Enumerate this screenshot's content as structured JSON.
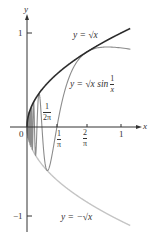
{
  "chart_data": {
    "type": "line",
    "title": "",
    "xlabel": "x",
    "ylabel": "y",
    "xlim": [
      0,
      1.1
    ],
    "ylim": [
      -1.1,
      1.15
    ],
    "grid": false,
    "x_ticks": [
      {
        "value": 0.1592,
        "label_num": "1",
        "label_den": "2π"
      },
      {
        "value": 0.3183,
        "label_num": "1",
        "label_den": "π"
      },
      {
        "value": 0.6366,
        "label_num": "2",
        "label_den": "π"
      },
      {
        "value": 1,
        "label": "1"
      }
    ],
    "y_ticks": [
      {
        "value": 1,
        "label": "1"
      },
      {
        "value": -1,
        "label": "−1"
      }
    ],
    "origin_label": "0",
    "series": [
      {
        "name": "y = √x",
        "function": "sqrt(x)",
        "color": "#2b2b2b",
        "width": 1.6
      },
      {
        "name": "y = √x sin(1/x)",
        "function": "sqrt(x)*sin(1/x)",
        "color": "#8c8c8c",
        "width": 1.1
      },
      {
        "name": "y = −√x",
        "function": "-sqrt(x)",
        "color": "#c4c4c4",
        "width": 1.4
      }
    ],
    "annotations": [
      {
        "text": "y = √x",
        "near": [
          0.68,
          0.94
        ]
      },
      {
        "text": "y = √x sin 1/x",
        "near": [
          0.63,
          0.5
        ]
      },
      {
        "text": "y = −√x",
        "near": [
          0.55,
          -0.98
        ]
      }
    ]
  },
  "labels": {
    "y_axis": "y",
    "x_axis": "x",
    "origin": "0",
    "y_one": "1",
    "y_neg_one": "−1",
    "x_one": "1",
    "sqrt_label": "y = √x",
    "sin_label_prefix": "y = √x sin",
    "sin_label_num": "1",
    "sin_label_den": "x",
    "neg_sqrt_label": "y = −√x",
    "tick_half_pi_num": "1",
    "tick_half_pi_den": "2π",
    "tick_inv_pi_num": "1",
    "tick_inv_pi_den": "π",
    "tick_two_pi_num": "2",
    "tick_two_pi_den": "π"
  }
}
